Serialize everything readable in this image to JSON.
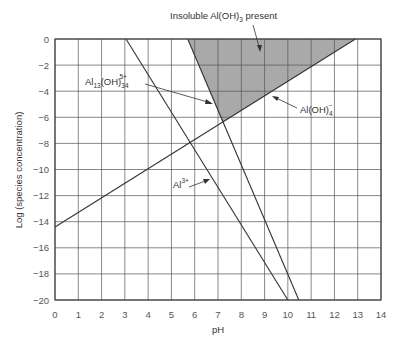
{
  "chart_data": {
    "type": "line",
    "title": "",
    "xlabel": "pH",
    "ylabel": "Log (species concentration)",
    "xlim": [
      0,
      14
    ],
    "ylim": [
      -20,
      0
    ],
    "x_ticks": [
      0,
      1,
      2,
      3,
      4,
      5,
      6,
      7,
      8,
      9,
      10,
      11,
      12,
      13,
      14
    ],
    "y_ticks": [
      0,
      -2,
      -4,
      -6,
      -8,
      -10,
      -12,
      -14,
      -16,
      -18,
      -20
    ],
    "grid": true,
    "series": [
      {
        "name": "Al3+",
        "x": [
          3.05,
          10.0
        ],
        "y": [
          0,
          -20
        ]
      },
      {
        "name": "Al13(OH)34 5+",
        "x": [
          5.7,
          10.47
        ],
        "y": [
          0,
          -20
        ]
      },
      {
        "name": "Al(OH)4-",
        "x": [
          0,
          12.9
        ],
        "y": [
          -14.4,
          0
        ]
      }
    ],
    "shaded_region": {
      "name": "Insoluble Al(OH)3 present",
      "polygon": [
        [
          5.7,
          0
        ],
        [
          12.9,
          0
        ],
        [
          7.2,
          -6.4
        ]
      ],
      "color": "#a9a9a9"
    },
    "annotations": [
      {
        "text": "Insoluble Al(OH)3 present",
        "points_to": [
          9.0,
          -1.8
        ]
      },
      {
        "text": "Al13(OH)34 5+",
        "points_to": [
          6.9,
          -5.0
        ]
      },
      {
        "text": "Al(OH)4-",
        "points_to": [
          7.9,
          -5.6
        ]
      },
      {
        "text": "Al3+",
        "points_to": [
          6.6,
          -9.2
        ]
      }
    ]
  },
  "labels": {
    "insoluble_main": "Insoluble Al(OH)",
    "insoluble_sub": "3",
    "insoluble_tail": " present",
    "al13_main": "Al",
    "al13_sub1": "13",
    "al13_mid": "(OH)",
    "al13_sub2": "34",
    "al13_sup": "5+",
    "aloh4_main": "Al(OH)",
    "aloh4_sub": "4",
    "aloh4_sup": "−",
    "al3_main": "Al",
    "al3_sup": "3+",
    "xlabel": "pH",
    "ylabel": "Log (species concentration)"
  }
}
